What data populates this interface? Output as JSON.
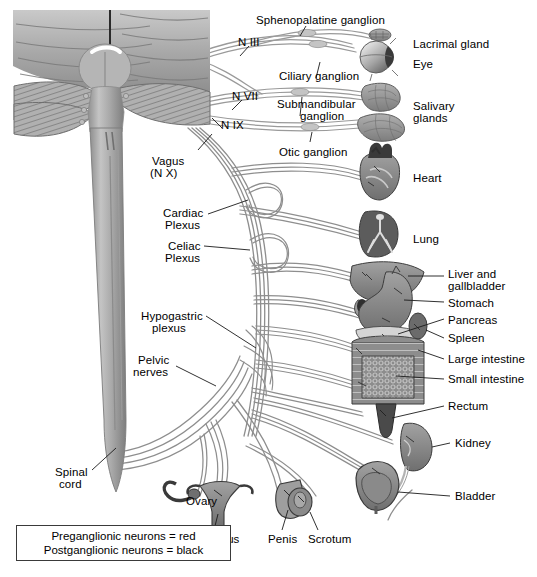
{
  "figure": {
    "background": "#ffffff",
    "nerve_color": "#8e8e8e",
    "outline_color": "#3a3a3a",
    "organ_fill": "#8a8a8a",
    "organ_fill_dark": "#5e5e5e",
    "organ_fill_light": "#b4b4b4"
  },
  "legend": {
    "line1": "Preganglionic neurons = red",
    "line2": "Postganglionic neurons = black"
  },
  "cranial_nerves": [
    {
      "label": "N III",
      "x": 238,
      "y": 36
    },
    {
      "label": "N VII",
      "x": 232,
      "y": 90
    },
    {
      "label": "N IX",
      "x": 221,
      "y": 119
    }
  ],
  "vagus": {
    "line1": "Vagus",
    "line2": "(N X)"
  },
  "ganglia": [
    {
      "label": "Sphenopalatine ganglion",
      "x": 256,
      "y": 14
    },
    {
      "label": "Ciliary ganglion",
      "x": 279,
      "y": 70
    },
    {
      "label": "Submandibular",
      "x": 277,
      "y": 98
    },
    {
      "label": "ganglion",
      "x": 300,
      "y": 110
    },
    {
      "label": "Otic ganglion",
      "x": 279,
      "y": 146
    }
  ],
  "plexuses": [
    {
      "line1": "Cardiac",
      "line2": "Plexus",
      "x": 163,
      "y": 207
    },
    {
      "line1": "Celiac",
      "line2": "Plexus",
      "x": 168,
      "y": 240
    },
    {
      "line1": "Hypogastric",
      "line2": "plexus",
      "x": 141,
      "y": 310
    },
    {
      "line1": "Pelvic",
      "line2": "nerves",
      "x": 138,
      "y": 354
    }
  ],
  "spinal_cord": {
    "line1": "Spinal",
    "line2": "cord",
    "x": 55,
    "y": 470
  },
  "organs_right": [
    {
      "label": "Lacrimal gland",
      "x": 413,
      "y": 38
    },
    {
      "label": "Eye",
      "x": 413,
      "y": 58
    },
    {
      "label": "Salivary",
      "x": 413,
      "y": 100
    },
    {
      "label": "glands",
      "x": 413,
      "y": 112
    },
    {
      "label": "Heart",
      "x": 413,
      "y": 172
    },
    {
      "label": "Lung",
      "x": 413,
      "y": 233
    },
    {
      "label": "Liver and",
      "x": 448,
      "y": 271
    },
    {
      "label": "gallbladder",
      "x": 448,
      "y": 283
    },
    {
      "label": "Stomach",
      "x": 448,
      "y": 300
    },
    {
      "label": "Pancreas",
      "x": 448,
      "y": 317
    },
    {
      "label": "Spleen",
      "x": 448,
      "y": 336
    },
    {
      "label": "Large intestine",
      "x": 448,
      "y": 357
    },
    {
      "label": "Small intestine",
      "x": 448,
      "y": 377
    },
    {
      "label": "Rectum",
      "x": 448,
      "y": 404
    },
    {
      "label": "Kidney",
      "x": 455,
      "y": 441
    },
    {
      "label": "Bladder",
      "x": 455,
      "y": 494
    }
  ],
  "organs_bottom": [
    {
      "label": "Ovary",
      "x": 186,
      "y": 497
    },
    {
      "label": "Uterus",
      "x": 219,
      "y": 537
    },
    {
      "label": "Penis",
      "x": 276,
      "y": 537
    },
    {
      "label": "Scrotum",
      "x": 316,
      "y": 537
    }
  ]
}
